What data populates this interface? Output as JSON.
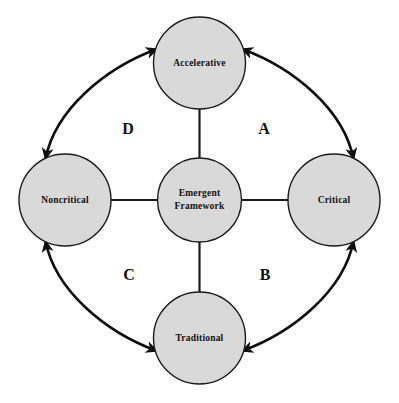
{
  "diagram": {
    "background_color": "#ffffff",
    "node_fill_color": "#d9d9d9",
    "node_stroke_color": "#1b1b1b",
    "line_color": "#0d0d0d",
    "center_node": {
      "id": "emergent-framework",
      "label_line1": "Emergent",
      "label_line2": "Framework",
      "cx": 199.5,
      "cy": 200,
      "r": 42
    },
    "outer_nodes": [
      {
        "id": "accelerative",
        "label": "Accelerative",
        "position": "top",
        "cx": 199.5,
        "cy": 63,
        "r": 46
      },
      {
        "id": "critical",
        "label": "Critical",
        "position": "right",
        "cx": 334,
        "cy": 200,
        "r": 46
      },
      {
        "id": "traditional",
        "label": "Traditional",
        "position": "bottom",
        "cx": 199.5,
        "cy": 338,
        "r": 46
      },
      {
        "id": "noncritical",
        "label": "Noncritical",
        "position": "left",
        "cx": 65,
        "cy": 200,
        "r": 46
      }
    ],
    "spokes": [
      {
        "id": "spoke-center-accelerative",
        "from": "emergent-framework",
        "to": "accelerative",
        "arrowheads": "none"
      },
      {
        "id": "spoke-center-critical",
        "from": "emergent-framework",
        "to": "critical",
        "arrowheads": "none"
      },
      {
        "id": "spoke-center-traditional",
        "from": "emergent-framework",
        "to": "traditional",
        "arrowheads": "none"
      },
      {
        "id": "spoke-center-noncritical",
        "from": "emergent-framework",
        "to": "noncritical",
        "arrowheads": "none"
      }
    ],
    "arcs": [
      {
        "id": "arc-a",
        "label": "A",
        "quadrant": "top-right",
        "between": [
          "accelerative",
          "critical"
        ],
        "arrowheads": "both",
        "label_x": 264,
        "label_y": 130
      },
      {
        "id": "arc-b",
        "label": "B",
        "quadrant": "bottom-right",
        "between": [
          "critical",
          "traditional"
        ],
        "arrowheads": "both",
        "label_x": 265,
        "label_y": 276
      },
      {
        "id": "arc-c",
        "label": "C",
        "quadrant": "bottom-left",
        "between": [
          "traditional",
          "noncritical"
        ],
        "arrowheads": "both",
        "label_x": 129,
        "label_y": 276
      },
      {
        "id": "arc-d",
        "label": "D",
        "quadrant": "top-left",
        "between": [
          "noncritical",
          "accelerative"
        ],
        "arrowheads": "both",
        "label_x": 128,
        "label_y": 130
      }
    ]
  }
}
